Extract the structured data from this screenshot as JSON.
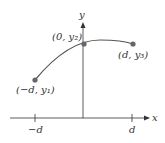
{
  "diagram": {
    "axes": {
      "x_label": "x",
      "y_label": "y"
    },
    "ticks": [
      {
        "label": "−d",
        "x": 35
      },
      {
        "label": "d",
        "x": 132
      }
    ],
    "points": [
      {
        "label": "(−d, y₁)",
        "x": 35,
        "y": 80
      },
      {
        "label": "(0, y₂)",
        "x": 84,
        "y": 44
      },
      {
        "label": "(d, y₃)",
        "x": 133,
        "y": 44
      }
    ],
    "colors": {
      "axis": "#333333",
      "curve": "#555555",
      "point": "#666666"
    }
  }
}
